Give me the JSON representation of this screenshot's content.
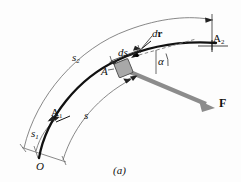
{
  "figure": {
    "caption": "(a)",
    "background_color": "#fdfdfd",
    "ink_color": "#111111",
    "thin_line_color": "#6a6a6a",
    "force_arrow_color": "#8c8c8c",
    "block_fill_color": "#a8a8a8",
    "width_px": 241,
    "height_px": 182
  },
  "labels": {
    "path_coordinate_outer": "s",
    "path_coordinate_outer_sub": "2",
    "path_coordinate_inner": "s",
    "path_coordinate_start": "s",
    "path_coordinate_start_sub": "1",
    "point_start": "A",
    "point_start_sub": "1",
    "point_end": "A",
    "point_end_sub": "2",
    "point_current": "A",
    "origin": "O",
    "differential_arc": "ds",
    "differential_displacement_d": "d",
    "differential_displacement_r": "r",
    "angle": "α",
    "force": "F"
  },
  "elements": {
    "path_curve": "thick-black-curved-path",
    "outer_dimension_arc": "s2-dimension-arc",
    "inner_dimension_arc": "s-dimension-arc",
    "start_dimension_arc": "s1-dimension-arc",
    "block": "particle-block-at-A",
    "force_vector": "force-arrow-F",
    "tangent_line": "dashed-tangent-line",
    "angle_arc": "alpha-angle-arc"
  }
}
